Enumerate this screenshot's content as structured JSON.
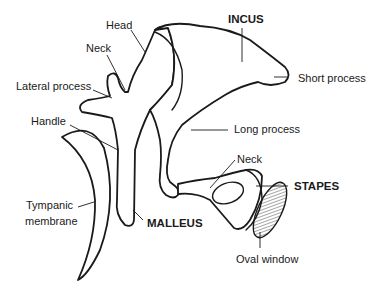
{
  "diagram": {
    "labels": {
      "head": "Head",
      "neck_malleus": "Neck",
      "lateral_process": "Lateral process",
      "handle": "Handle",
      "tympanic_membrane_1": "Tympanic",
      "tympanic_membrane_2": "membrane",
      "malleus": "MALLEUS",
      "incus": "INCUS",
      "short_process": "Short process",
      "long_process": "Long process",
      "neck_stapes": "Neck",
      "stapes": "STAPES",
      "oval_window": "Oval window"
    },
    "colors": {
      "line": "#1a1a1a",
      "background": "#ffffff"
    }
  }
}
